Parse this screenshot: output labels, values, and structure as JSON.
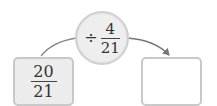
{
  "operation": {
    "operator": "÷",
    "fraction": {
      "numerator": "4",
      "denominator": "21"
    }
  },
  "input_box": {
    "fraction": {
      "numerator": "20",
      "denominator": "21"
    }
  },
  "output_box": {
    "value": ""
  },
  "colors": {
    "circle_fill": "#eeeeee",
    "box_fill": "#ececec",
    "border": "#c8c8c8",
    "arrow": "#777777"
  }
}
